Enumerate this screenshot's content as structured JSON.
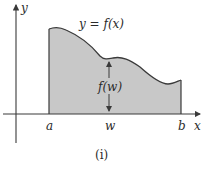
{
  "figure": {
    "caption": "(i)",
    "curve_label": "y = f(x)",
    "height_label": "f(w)",
    "axis_labels": {
      "x": "x",
      "y": "y"
    },
    "tick_labels": {
      "a": "a",
      "w": "w",
      "b": "b"
    },
    "colors": {
      "fill": "#c8c8c8",
      "stroke": "#3a3a3a",
      "background": "#ffffff"
    }
  }
}
